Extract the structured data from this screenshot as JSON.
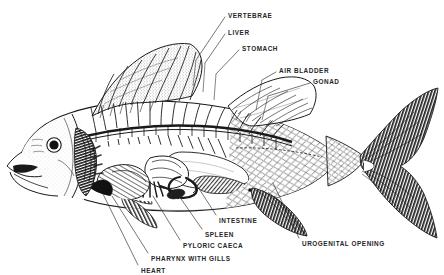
{
  "figure": {
    "style": "black-and-white line engraving",
    "background_color": "#ffffff",
    "ink_color": "#1a1a1a",
    "label_color": "#262626"
  },
  "labels": [
    {
      "id": "vertebrae",
      "text": "VERTEBRAE",
      "x": 228,
      "y": 13,
      "leader": {
        "x1": 225,
        "y1": 17,
        "x2": 196,
        "y2": 60
      }
    },
    {
      "id": "liver",
      "text": "LIVER",
      "x": 228,
      "y": 30,
      "leader": {
        "x1": 225,
        "y1": 34,
        "x2": 205,
        "y2": 63
      }
    },
    {
      "id": "stomach",
      "text": "STOMACH",
      "x": 242,
      "y": 46,
      "leader": {
        "x1": 239,
        "y1": 50,
        "x2": 216,
        "y2": 74
      }
    },
    {
      "id": "air-bladder",
      "text": "AIR BLADDER",
      "x": 279,
      "y": 68,
      "leader": {
        "x1": 276,
        "y1": 72,
        "x2": 262,
        "y2": 80
      }
    },
    {
      "id": "gonad",
      "text": "GONAD",
      "x": 313,
      "y": 79,
      "leader": {
        "x1": 310,
        "y1": 83,
        "x2": 268,
        "y2": 96
      }
    },
    {
      "id": "intestine",
      "text": "INTESTINE",
      "x": 219,
      "y": 218,
      "leader": {
        "x1": 216,
        "y1": 215,
        "x2": 196,
        "y2": 184
      }
    },
    {
      "id": "spleen",
      "text": "SPLEEN",
      "x": 205,
      "y": 232,
      "leader": {
        "x1": 202,
        "y1": 229,
        "x2": 179,
        "y2": 196
      }
    },
    {
      "id": "pyloric-caeca",
      "text": "PYLORIC CAECA",
      "x": 183,
      "y": 243,
      "leader": {
        "x1": 180,
        "y1": 240,
        "x2": 153,
        "y2": 196
      }
    },
    {
      "id": "pharynx-with-gills",
      "text": "PHARYNX WITH GILLS",
      "x": 151,
      "y": 256,
      "leader": {
        "x1": 148,
        "y1": 253,
        "x2": 112,
        "y2": 196
      }
    },
    {
      "id": "heart",
      "text": "HEART",
      "x": 141,
      "y": 268,
      "leader": {
        "x1": 138,
        "y1": 265,
        "x2": 103,
        "y2": 194
      }
    },
    {
      "id": "urogenital-opening",
      "text": "UROGENITAL OPENING",
      "x": 302,
      "y": 241,
      "leader": {
        "x1": 299,
        "y1": 238,
        "x2": 273,
        "y2": 183
      }
    }
  ]
}
